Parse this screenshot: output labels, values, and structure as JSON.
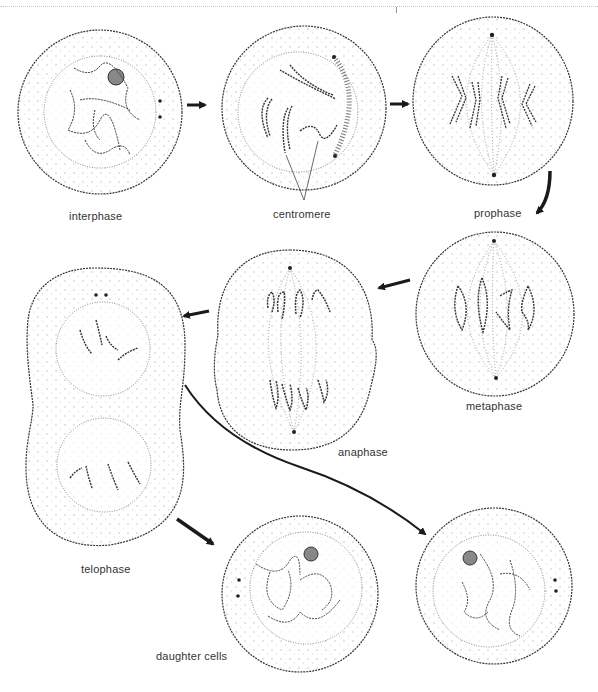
{
  "diagram": {
    "colors": {
      "outline": "#333333",
      "stipple": "#bdbdbd",
      "arrow": "#1a1a1a",
      "label": "#333333"
    },
    "stages": [
      {
        "id": "interphase",
        "label": "interphase"
      },
      {
        "id": "early-prophase",
        "label": "centromere"
      },
      {
        "id": "prophase",
        "label": "prophase"
      },
      {
        "id": "metaphase",
        "label": "metaphase"
      },
      {
        "id": "anaphase",
        "label": "anaphase"
      },
      {
        "id": "telophase",
        "label": "telophase"
      },
      {
        "id": "daughter-cells",
        "label": "daughter cells"
      }
    ],
    "flow": [
      "interphase -> centromere",
      "centromere -> prophase",
      "prophase -> metaphase",
      "metaphase -> anaphase",
      "anaphase -> telophase",
      "telophase -> daughter cell 1",
      "telophase -> daughter cell 2"
    ]
  }
}
